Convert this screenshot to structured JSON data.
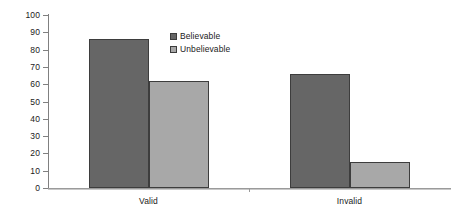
{
  "chart_data": {
    "type": "bar",
    "title": "",
    "subtitle": "",
    "xlabel": "",
    "ylabel": "",
    "categories": [
      "Valid",
      "Invalid"
    ],
    "series": [
      {
        "name": "Believable",
        "color": "#666666",
        "values": [
          86,
          66
        ]
      },
      {
        "name": "Unbelievable",
        "color": "#a8a8a8",
        "values": [
          62,
          15
        ]
      }
    ],
    "ylim": [
      0,
      100
    ],
    "ytick_step": 10,
    "yticks": [
      0,
      10,
      20,
      30,
      40,
      50,
      60,
      70,
      80,
      90,
      100
    ],
    "ytick_labels": [
      "0",
      "10",
      "20",
      "30",
      "40",
      "50",
      "60",
      "70",
      "80",
      "90",
      "100"
    ],
    "grid": false,
    "legend_position": "inside-upper-left-of-plot",
    "legend_entries": [
      "Believable",
      "Unbelievable"
    ],
    "bar_outline_color": "#3d3d3d",
    "axis_color": "#808080",
    "background": "#ffffff"
  }
}
